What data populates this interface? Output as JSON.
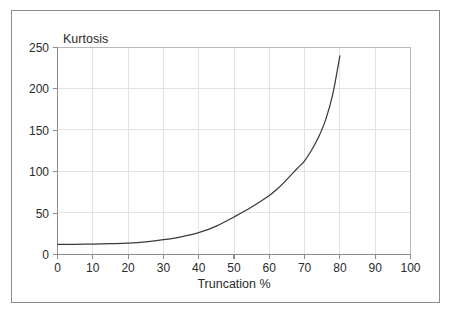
{
  "figure": {
    "background_color": "#ffffff",
    "frame_color": "#8c8c8c"
  },
  "chart_data": {
    "type": "line",
    "title": "",
    "subtitle": "",
    "xlabel": "Truncation %",
    "ylabel": "Kurtosis",
    "ylabel_position": "above-axis-top-left",
    "xlim": [
      0,
      100
    ],
    "ylim": [
      0,
      250
    ],
    "xticks": [
      0,
      10,
      20,
      30,
      40,
      50,
      60,
      70,
      80,
      90,
      100
    ],
    "yticks": [
      0,
      50,
      100,
      150,
      200,
      250
    ],
    "xtick_labels": [
      "0",
      "10",
      "20",
      "30",
      "40",
      "50",
      "60",
      "70",
      "80",
      "90",
      "100"
    ],
    "ytick_labels": [
      "0",
      "50",
      "100",
      "150",
      "200",
      "250"
    ],
    "grid": true,
    "grid_color": "#e2e2e2",
    "legend": false,
    "legend_position": "none",
    "series": [
      {
        "name": "Kurtosis vs Truncation",
        "color": "#3a3a3a",
        "line_width": 1.25,
        "x": [
          0,
          5,
          10,
          15,
          20,
          25,
          30,
          35,
          40,
          45,
          50,
          55,
          60,
          62,
          64,
          66,
          68,
          70,
          72,
          74,
          76,
          78,
          80
        ],
        "values": [
          12,
          12,
          12.3,
          12.8,
          13.5,
          15,
          17.5,
          21,
          26,
          34,
          45,
          57,
          71,
          78,
          86,
          95,
          104,
          113,
          126,
          142,
          163,
          194,
          240
        ]
      }
    ],
    "annotations": []
  },
  "axis_titles": {
    "x": "Truncation %",
    "y": "Kurtosis"
  }
}
